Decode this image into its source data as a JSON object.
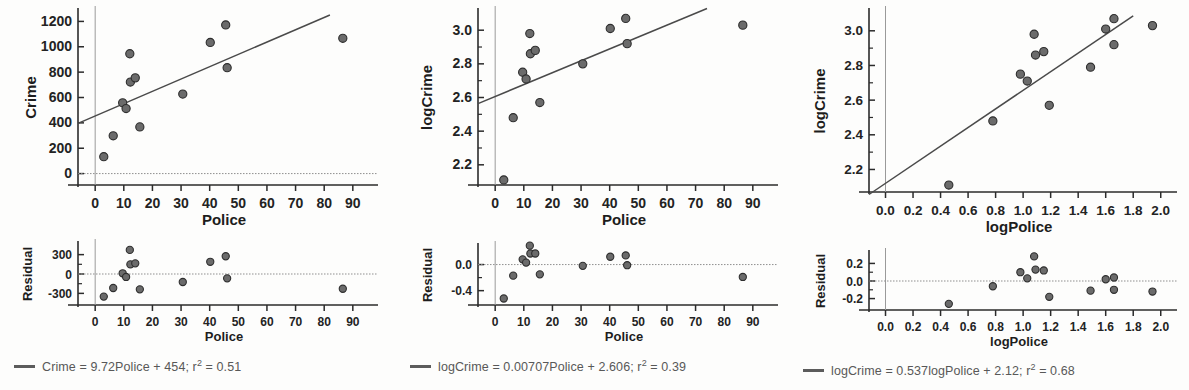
{
  "figure": {
    "type": "scatter-with-residuals",
    "panel_count": 3,
    "marker_color": "#6b6b6b",
    "line_color": "#4a4a4a",
    "axis_color": "#2b2b2b"
  },
  "panels": [
    {
      "id": "crime-vs-police",
      "scatter": {
        "ylabel": "Crime",
        "xlabel": "Police",
        "yticks": [
          "0",
          "200",
          "400",
          "600",
          "800",
          "1000",
          "1200"
        ],
        "ytick_values": [
          0,
          200,
          400,
          600,
          800,
          1000,
          1200
        ],
        "xticks": [
          "0",
          "10",
          "20",
          "30",
          "40",
          "50",
          "60",
          "70",
          "80",
          "90"
        ],
        "xtick_values": [
          0,
          10,
          20,
          30,
          40,
          50,
          60,
          70,
          80,
          90
        ],
        "xlim": [
          -6,
          96
        ],
        "ylim": [
          -90,
          1290
        ]
      },
      "residual": {
        "ylabel": "Residual",
        "xlabel": "Police",
        "yticks": [
          "300",
          "0",
          "-300"
        ],
        "ytick_values": [
          300,
          0,
          -300
        ],
        "xticks": [
          "0",
          "10",
          "20",
          "30",
          "40",
          "50",
          "60",
          "70",
          "80",
          "90"
        ],
        "xtick_values": [
          0,
          10,
          20,
          30,
          40,
          50,
          60,
          70,
          80,
          90
        ],
        "xlim": [
          -6,
          96
        ],
        "ylim": [
          -480,
          480
        ]
      },
      "legend": "Crime = 9.72Police + 454; r",
      "legend_sup": "2",
      "legend_tail": " = 0.51",
      "fit": {
        "slope": 9.72,
        "intercept": 454,
        "r2": 0.51
      }
    },
    {
      "id": "logcrime-vs-police",
      "scatter": {
        "ylabel": "logCrime",
        "xlabel": "Police",
        "yticks": [
          "2.2",
          "2.4",
          "2.6",
          "2.8",
          "3.0"
        ],
        "ytick_values": [
          2.2,
          2.4,
          2.6,
          2.8,
          3.0
        ],
        "xticks": [
          "0",
          "10",
          "20",
          "30",
          "40",
          "50",
          "60",
          "70",
          "80",
          "90"
        ],
        "xtick_values": [
          0,
          10,
          20,
          30,
          40,
          50,
          60,
          70,
          80,
          90
        ],
        "xlim": [
          -6,
          96
        ],
        "ylim": [
          2.08,
          3.12
        ]
      },
      "residual": {
        "ylabel": "Residual",
        "xlabel": "Police",
        "yticks": [
          "0.0",
          "-0.4"
        ],
        "ytick_values": [
          0.0,
          -0.4
        ],
        "xticks": [
          "0",
          "10",
          "20",
          "30",
          "40",
          "50",
          "60",
          "70",
          "80",
          "90"
        ],
        "xtick_values": [
          0,
          10,
          20,
          30,
          40,
          50,
          60,
          70,
          80,
          90
        ],
        "xlim": [
          -6,
          96
        ],
        "ylim": [
          -0.62,
          0.3
        ]
      },
      "legend": "logCrime = 0.00707Police + 2.606; r",
      "legend_sup": "2",
      "legend_tail": " = 0.39",
      "fit": {
        "slope": 0.00707,
        "intercept": 2.606,
        "r2": 0.39
      }
    },
    {
      "id": "logcrime-vs-logpolice",
      "scatter": {
        "ylabel": "logCrime",
        "xlabel": "logPolice",
        "yticks": [
          "2.2",
          "2.4",
          "2.6",
          "2.8",
          "3.0"
        ],
        "ytick_values": [
          2.2,
          2.4,
          2.6,
          2.8,
          3.0
        ],
        "xticks": [
          "0.0",
          "0.2",
          "0.4",
          "0.6",
          "0.8",
          "1.0",
          "1.2",
          "1.4",
          "1.6",
          "1.8",
          "2.0"
        ],
        "xtick_values": [
          0.0,
          0.2,
          0.4,
          0.6,
          0.8,
          1.0,
          1.2,
          1.4,
          1.6,
          1.8,
          2.0
        ],
        "xlim": [
          -0.12,
          2.06
        ],
        "ylim": [
          2.07,
          3.12
        ]
      },
      "residual": {
        "ylabel": "Residual",
        "xlabel": "logPolice",
        "yticks": [
          "0.2",
          "0.0",
          "-0.2"
        ],
        "ytick_values": [
          0.2,
          0.0,
          -0.2
        ],
        "xticks": [
          "0.0",
          "0.2",
          "0.4",
          "0.6",
          "0.8",
          "1.0",
          "1.2",
          "1.4",
          "1.6",
          "1.8",
          "2.0"
        ],
        "xtick_values": [
          0.0,
          0.2,
          0.4,
          0.6,
          0.8,
          1.0,
          1.2,
          1.4,
          1.6,
          1.8,
          2.0
        ],
        "xlim": [
          -0.12,
          2.06
        ],
        "ylim": [
          -0.33,
          0.33
        ]
      },
      "legend": "logCrime = 0.537logPolice + 2.12; r",
      "legend_sup": "2",
      "legend_tail": " = 0.68",
      "fit": {
        "slope": 0.537,
        "intercept": 2.12,
        "r2": 0.68
      }
    }
  ],
  "chart_data": [
    {
      "type": "scatter",
      "title": "",
      "xlabel": "Police",
      "ylabel": "Crime",
      "xlim": [
        -6,
        96
      ],
      "ylim": [
        -90,
        1290
      ],
      "grid": false,
      "legend": "Crime = 9.72Police + 454; r2 = 0.51",
      "fit_line": {
        "slope": 9.72,
        "intercept": 454,
        "r2": 0.51
      },
      "points": [
        {
          "x": 3.0,
          "y": 133
        },
        {
          "x": 6.3,
          "y": 298
        },
        {
          "x": 9.6,
          "y": 558
        },
        {
          "x": 10.8,
          "y": 513
        },
        {
          "x": 12.1,
          "y": 945
        },
        {
          "x": 12.3,
          "y": 722
        },
        {
          "x": 14.0,
          "y": 755
        },
        {
          "x": 15.6,
          "y": 368
        },
        {
          "x": 30.6,
          "y": 627
        },
        {
          "x": 40.2,
          "y": 1034
        },
        {
          "x": 45.6,
          "y": 1172
        },
        {
          "x": 46.1,
          "y": 835
        },
        {
          "x": 86.5,
          "y": 1067
        }
      ]
    },
    {
      "type": "scatter",
      "title": "",
      "xlabel": "Police",
      "ylabel": "Residual",
      "xlim": [
        -6,
        96
      ],
      "ylim": [
        -480,
        480
      ],
      "grid": false,
      "reference_line_y": 0,
      "points": [
        {
          "x": 3.0,
          "y": -350
        },
        {
          "x": 6.3,
          "y": -217
        },
        {
          "x": 9.6,
          "y": 11
        },
        {
          "x": 10.8,
          "y": -46
        },
        {
          "x": 12.1,
          "y": 373
        },
        {
          "x": 12.3,
          "y": 149
        },
        {
          "x": 14.0,
          "y": 165
        },
        {
          "x": 15.6,
          "y": -238
        },
        {
          "x": 30.6,
          "y": -124
        },
        {
          "x": 40.2,
          "y": 189
        },
        {
          "x": 45.6,
          "y": 275
        },
        {
          "x": 46.1,
          "y": -67
        },
        {
          "x": 86.5,
          "y": -228
        }
      ]
    },
    {
      "type": "scatter",
      "title": "",
      "xlabel": "Police",
      "ylabel": "logCrime",
      "xlim": [
        -6,
        96
      ],
      "ylim": [
        2.08,
        3.12
      ],
      "grid": false,
      "legend": "logCrime = 0.00707Police + 2.606; r2 = 0.39",
      "fit_line": {
        "slope": 0.00707,
        "intercept": 2.606,
        "r2": 0.39
      },
      "points": [
        {
          "x": 3.0,
          "y": 2.11
        },
        {
          "x": 6.3,
          "y": 2.48
        },
        {
          "x": 9.6,
          "y": 2.75
        },
        {
          "x": 10.8,
          "y": 2.71
        },
        {
          "x": 12.1,
          "y": 2.98
        },
        {
          "x": 12.3,
          "y": 2.86
        },
        {
          "x": 14.0,
          "y": 2.88
        },
        {
          "x": 15.6,
          "y": 2.57
        },
        {
          "x": 30.6,
          "y": 2.8
        },
        {
          "x": 40.2,
          "y": 3.01
        },
        {
          "x": 45.6,
          "y": 3.07
        },
        {
          "x": 46.1,
          "y": 2.92
        },
        {
          "x": 86.5,
          "y": 3.03
        }
      ]
    },
    {
      "type": "scatter",
      "title": "",
      "xlabel": "Police",
      "ylabel": "Residual",
      "xlim": [
        -6,
        96
      ],
      "ylim": [
        -0.62,
        0.3
      ],
      "grid": false,
      "reference_line_y": 0,
      "points": [
        {
          "x": 3.0,
          "y": -0.52
        },
        {
          "x": 6.3,
          "y": -0.17
        },
        {
          "x": 9.6,
          "y": 0.08
        },
        {
          "x": 10.8,
          "y": 0.03
        },
        {
          "x": 12.1,
          "y": 0.29
        },
        {
          "x": 12.3,
          "y": 0.17
        },
        {
          "x": 14.0,
          "y": 0.17
        },
        {
          "x": 15.6,
          "y": -0.15
        },
        {
          "x": 30.6,
          "y": -0.02
        },
        {
          "x": 40.2,
          "y": 0.12
        },
        {
          "x": 45.6,
          "y": 0.14
        },
        {
          "x": 46.1,
          "y": -0.01
        },
        {
          "x": 86.5,
          "y": -0.19
        }
      ]
    },
    {
      "type": "scatter",
      "title": "",
      "xlabel": "logPolice",
      "ylabel": "logCrime",
      "xlim": [
        -0.12,
        2.06
      ],
      "ylim": [
        2.07,
        3.12
      ],
      "grid": false,
      "legend": "logCrime = 0.537logPolice + 2.12; r2 = 0.68",
      "fit_line": {
        "slope": 0.537,
        "intercept": 2.12,
        "r2": 0.68
      },
      "points": [
        {
          "x": 0.46,
          "y": 2.11
        },
        {
          "x": 0.78,
          "y": 2.48
        },
        {
          "x": 0.98,
          "y": 2.75
        },
        {
          "x": 1.03,
          "y": 2.71
        },
        {
          "x": 1.08,
          "y": 2.98
        },
        {
          "x": 1.09,
          "y": 2.86
        },
        {
          "x": 1.15,
          "y": 2.88
        },
        {
          "x": 1.19,
          "y": 2.57
        },
        {
          "x": 1.49,
          "y": 2.79
        },
        {
          "x": 1.6,
          "y": 3.01
        },
        {
          "x": 1.66,
          "y": 3.07
        },
        {
          "x": 1.66,
          "y": 2.92
        },
        {
          "x": 1.94,
          "y": 3.03
        }
      ]
    },
    {
      "type": "scatter",
      "title": "",
      "xlabel": "logPolice",
      "ylabel": "Residual",
      "xlim": [
        -0.12,
        2.06
      ],
      "ylim": [
        -0.33,
        0.33
      ],
      "grid": false,
      "reference_line_y": 0,
      "points": [
        {
          "x": 0.46,
          "y": -0.26
        },
        {
          "x": 0.78,
          "y": -0.06
        },
        {
          "x": 0.98,
          "y": 0.1
        },
        {
          "x": 1.03,
          "y": 0.03
        },
        {
          "x": 1.08,
          "y": 0.28
        },
        {
          "x": 1.09,
          "y": 0.13
        },
        {
          "x": 1.15,
          "y": 0.12
        },
        {
          "x": 1.19,
          "y": -0.18
        },
        {
          "x": 1.49,
          "y": -0.11
        },
        {
          "x": 1.6,
          "y": 0.02
        },
        {
          "x": 1.66,
          "y": 0.04
        },
        {
          "x": 1.66,
          "y": -0.1
        },
        {
          "x": 1.94,
          "y": -0.12
        }
      ]
    }
  ]
}
